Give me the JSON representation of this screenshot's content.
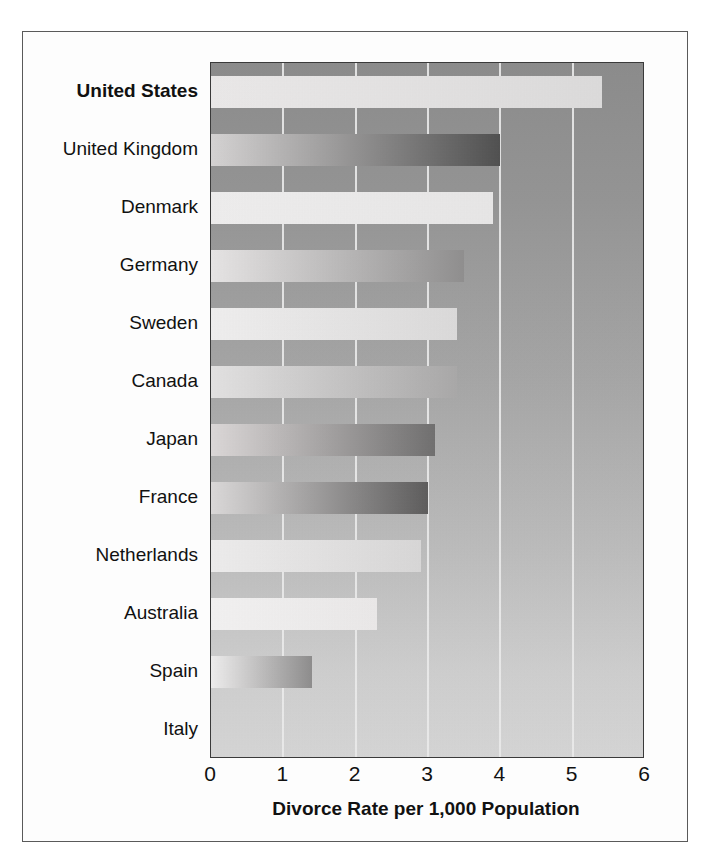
{
  "chart_data": {
    "type": "bar",
    "orientation": "horizontal",
    "title": "",
    "xlabel": "Divorce Rate per 1,000 Population",
    "ylabel": "",
    "xlim": [
      0,
      6
    ],
    "xticks": [
      "0",
      "1",
      "2",
      "3",
      "4",
      "5",
      "6"
    ],
    "grid": true,
    "legend": "none",
    "categories": [
      "United States",
      "United Kingdom",
      "Denmark",
      "Germany",
      "Sweden",
      "Canada",
      "Japan",
      "France",
      "Netherlands",
      "Australia",
      "Spain",
      "Italy"
    ],
    "values": [
      5.4,
      4.0,
      3.9,
      3.5,
      3.4,
      3.4,
      3.1,
      3.0,
      2.9,
      2.3,
      1.4,
      1.0
    ],
    "emphasized_category": "United States",
    "bar_fills": [
      {
        "from": "#eceaea",
        "to": "#dddcdc"
      },
      {
        "from": "#d6d4d4",
        "to": "#4e4e4e"
      },
      {
        "from": "#f0efef",
        "to": "#e9e8e8"
      },
      {
        "from": "#e8e6e6",
        "to": "#8f8e8e"
      },
      {
        "from": "#f1f0f0",
        "to": "#dcdbdb"
      },
      {
        "from": "#e4e3e3",
        "to": "#a9a8a8"
      },
      {
        "from": "#ddd9d9",
        "to": "#6f6e6e"
      },
      {
        "from": "#dcdada",
        "to": "#5c5b5b"
      },
      {
        "from": "#efeeee",
        "to": "#d9d8d8"
      },
      {
        "from": "#f4f3f3",
        "to": "#eceaea"
      },
      {
        "from": "#f0efef",
        "to": "#8d8c8c"
      },
      {
        "from": "#e0dedе",
        "to": "#838282"
      }
    ]
  },
  "colors": {
    "plot_background_top": "#8b8b8b",
    "plot_background_bottom": "#d6d6d6",
    "gridline": "#ededed",
    "axis_line": "#3a3a3a",
    "text": "#111111",
    "page_background": "#ffffff",
    "frame_border": "#5a5a5a"
  }
}
